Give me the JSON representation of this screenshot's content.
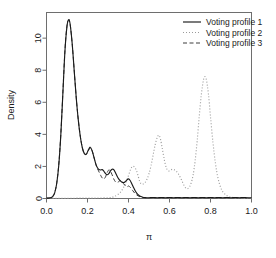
{
  "chart_data": {
    "type": "line",
    "title": "",
    "xlabel": "π",
    "ylabel": "Density",
    "xlim": [
      0.0,
      1.0
    ],
    "ylim": [
      0,
      11.6
    ],
    "grid": false,
    "legend_position": "top-right",
    "xticks": [
      "0.0",
      "0.2",
      "0.4",
      "0.6",
      "0.8",
      "1.0"
    ],
    "xtick_values": [
      0.0,
      0.2,
      0.4,
      0.6,
      0.8,
      1.0
    ],
    "yticks": [
      "0",
      "2",
      "4",
      "6",
      "8",
      "10"
    ],
    "ytick_values": [
      0,
      2,
      4,
      6,
      8,
      10
    ],
    "series": [
      {
        "name": "Voting profile 1",
        "style": "solid",
        "color": "#1a1a1a",
        "x": [
          0.0,
          0.02,
          0.03,
          0.04,
          0.05,
          0.06,
          0.07,
          0.08,
          0.09,
          0.1,
          0.108,
          0.115,
          0.125,
          0.135,
          0.145,
          0.155,
          0.165,
          0.175,
          0.185,
          0.195,
          0.205,
          0.213,
          0.222,
          0.232,
          0.242,
          0.252,
          0.262,
          0.272,
          0.28,
          0.288,
          0.296,
          0.304,
          0.312,
          0.32,
          0.328,
          0.336,
          0.344,
          0.352,
          0.36,
          0.368,
          0.376,
          0.384,
          0.392,
          0.4,
          0.408,
          0.416,
          0.424,
          0.432,
          0.44,
          0.45,
          0.46,
          0.47,
          0.48,
          0.49,
          0.5,
          0.52,
          0.54,
          0.56,
          0.58,
          0.6,
          0.62,
          0.64,
          0.66,
          0.68,
          0.7,
          0.72,
          0.74,
          0.76,
          0.78,
          0.8,
          0.82,
          0.84,
          0.86,
          0.88,
          0.9,
          0.92,
          0.94,
          0.96,
          0.98,
          1.0
        ],
        "y": [
          0.02,
          0.05,
          0.12,
          0.35,
          0.95,
          2.1,
          4.0,
          6.6,
          9.2,
          10.75,
          11.15,
          10.9,
          9.7,
          8.0,
          6.3,
          4.9,
          3.85,
          3.15,
          2.8,
          2.78,
          3.05,
          3.2,
          3.0,
          2.55,
          2.1,
          1.85,
          1.78,
          1.8,
          1.7,
          1.55,
          1.48,
          1.55,
          1.72,
          1.82,
          1.8,
          1.62,
          1.4,
          1.22,
          1.1,
          1.02,
          1.0,
          1.05,
          1.15,
          1.22,
          1.12,
          0.92,
          0.7,
          0.5,
          0.34,
          0.2,
          0.12,
          0.08,
          0.06,
          0.05,
          0.05,
          0.06,
          0.05,
          0.06,
          0.05,
          0.06,
          0.05,
          0.06,
          0.05,
          0.06,
          0.05,
          0.06,
          0.05,
          0.06,
          0.05,
          0.06,
          0.05,
          0.06,
          0.05,
          0.06,
          0.05,
          0.06,
          0.05,
          0.06,
          0.05,
          0.05
        ]
      },
      {
        "name": "Voting profile 2",
        "style": "dotted",
        "color": "#9a9a9a",
        "x": [
          0.0,
          0.05,
          0.1,
          0.15,
          0.2,
          0.25,
          0.3,
          0.33,
          0.36,
          0.38,
          0.395,
          0.41,
          0.42,
          0.43,
          0.44,
          0.448,
          0.455,
          0.462,
          0.47,
          0.48,
          0.49,
          0.5,
          0.51,
          0.52,
          0.53,
          0.54,
          0.548,
          0.556,
          0.565,
          0.575,
          0.585,
          0.595,
          0.605,
          0.615,
          0.625,
          0.635,
          0.645,
          0.655,
          0.665,
          0.675,
          0.685,
          0.695,
          0.705,
          0.715,
          0.725,
          0.735,
          0.745,
          0.755,
          0.765,
          0.772,
          0.78,
          0.79,
          0.8,
          0.812,
          0.824,
          0.836,
          0.848,
          0.86,
          0.875,
          0.89,
          0.91,
          0.93,
          0.95,
          0.97,
          1.0
        ],
        "y": [
          0.0,
          0.01,
          0.01,
          0.02,
          0.02,
          0.03,
          0.05,
          0.12,
          0.38,
          0.8,
          1.25,
          1.8,
          2.0,
          1.95,
          1.7,
          1.35,
          1.05,
          0.92,
          0.9,
          0.98,
          1.2,
          1.55,
          2.05,
          2.7,
          3.35,
          3.8,
          3.95,
          3.7,
          3.1,
          2.4,
          1.9,
          1.72,
          1.78,
          1.82,
          1.78,
          1.68,
          1.5,
          1.25,
          0.98,
          0.72,
          0.62,
          0.68,
          0.95,
          1.45,
          2.35,
          3.6,
          5.1,
          6.45,
          7.35,
          7.6,
          7.4,
          6.5,
          5.1,
          3.5,
          2.2,
          1.3,
          0.75,
          0.42,
          0.22,
          0.12,
          0.06,
          0.04,
          0.03,
          0.02,
          0.02
        ]
      },
      {
        "name": "Voting profile 3",
        "style": "dashed",
        "color": "#3d3d3d",
        "x": [
          0.0,
          0.02,
          0.03,
          0.04,
          0.05,
          0.06,
          0.07,
          0.08,
          0.09,
          0.1,
          0.108,
          0.116,
          0.126,
          0.136,
          0.146,
          0.156,
          0.166,
          0.176,
          0.186,
          0.196,
          0.206,
          0.214,
          0.224,
          0.234,
          0.244,
          0.254,
          0.264,
          0.272,
          0.28,
          0.288,
          0.296,
          0.304,
          0.312,
          0.32,
          0.328,
          0.336,
          0.344,
          0.352,
          0.36,
          0.368,
          0.376,
          0.384,
          0.392,
          0.4,
          0.41,
          0.42,
          0.43,
          0.44,
          0.45,
          0.46,
          0.47,
          0.485,
          0.5
        ],
        "y": [
          0.02,
          0.05,
          0.13,
          0.37,
          0.98,
          2.15,
          4.05,
          6.65,
          9.25,
          10.8,
          11.1,
          10.8,
          9.55,
          7.85,
          6.15,
          4.8,
          3.8,
          3.1,
          2.78,
          2.76,
          3.02,
          3.15,
          2.92,
          2.45,
          2.0,
          1.72,
          1.45,
          1.28,
          1.22,
          1.35,
          1.62,
          1.78,
          1.7,
          1.48,
          1.22,
          1.05,
          1.0,
          1.05,
          1.12,
          1.05,
          0.92,
          0.8,
          0.72,
          0.78,
          0.68,
          0.5,
          0.34,
          0.22,
          0.14,
          0.09,
          0.06,
          0.04,
          0.03
        ]
      }
    ]
  },
  "legend": {
    "entries": [
      {
        "label": "Voting profile 1"
      },
      {
        "label": "Voting profile 2"
      },
      {
        "label": "Voting profile 3"
      }
    ]
  }
}
